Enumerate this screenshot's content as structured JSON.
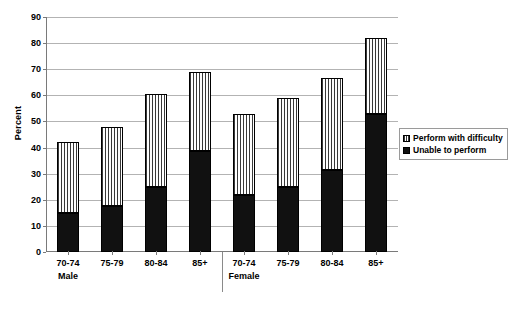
{
  "chart_data": {
    "type": "bar",
    "stacked": true,
    "title": "",
    "xlabel": "",
    "ylabel": "Percent",
    "ylim": [
      0,
      90
    ],
    "ytick_step": 10,
    "yticks": [
      0,
      10,
      20,
      30,
      40,
      50,
      60,
      70,
      80,
      90
    ],
    "ytick_labels": [
      "0",
      "10",
      "20",
      "30",
      "40",
      "50",
      "60",
      "70",
      "80",
      "90"
    ],
    "grid": true,
    "grid_axis": "y",
    "legend_position": "right",
    "categories": [
      "70-74",
      "75-79",
      "80-84",
      "85+",
      "70-74",
      "75-79",
      "80-84",
      "85+"
    ],
    "groups": [
      {
        "name": "Male",
        "categories": [
          "70-74",
          "75-79",
          "80-84",
          "85+"
        ]
      },
      {
        "name": "Female",
        "categories": [
          "70-74",
          "75-79",
          "80-84",
          "85+"
        ]
      }
    ],
    "series": [
      {
        "name": "Unable to perform",
        "fill": "solid-black",
        "color": "#111111",
        "values": [
          15,
          17.5,
          25,
          38.5,
          22,
          25,
          31.5,
          53
        ]
      },
      {
        "name": "Perform with difficulty",
        "fill": "vertical-hatch",
        "color": "#ffffff",
        "values": [
          27,
          30.5,
          35.5,
          30.5,
          31,
          34,
          35,
          29
        ]
      }
    ],
    "totals": [
      42,
      48,
      60.5,
      69,
      53,
      59,
      66.5,
      82
    ]
  },
  "axes": {
    "y_title": "Percent",
    "group_labels": [
      "Male",
      "Female"
    ]
  },
  "legend": {
    "items": [
      {
        "label": "Perform with difficulty",
        "swatch": "hatch"
      },
      {
        "label": "Unable to perform",
        "swatch": "solid"
      }
    ]
  },
  "colors": {
    "solid": "#111111",
    "hatch_line": "#3a3a3a",
    "background": "#ffffff",
    "gridline": "#b3b3b3",
    "axis": "#7a7a7a",
    "legend_border": "#9a9a9a"
  }
}
